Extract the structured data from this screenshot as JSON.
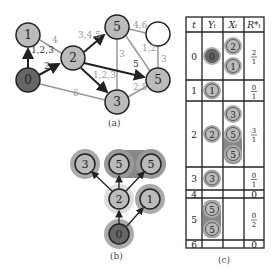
{
  "panels": {
    "a": {
      "caption": "(a)",
      "nodes": [
        {
          "id": "n1",
          "label": "1",
          "x": 28,
          "y": 35,
          "fill": "#bbbbbb"
        },
        {
          "id": "n0",
          "label": "0",
          "x": 28,
          "y": 80,
          "fill": "#666666"
        },
        {
          "id": "n2",
          "label": "2",
          "x": 73,
          "y": 58,
          "fill": "#bbbbbb"
        },
        {
          "id": "n5a",
          "label": "5",
          "x": 117,
          "y": 27,
          "fill": "#bbbbbb"
        },
        {
          "id": "nw",
          "label": "",
          "x": 158,
          "y": 34,
          "fill": "#ffffff"
        },
        {
          "id": "n5b",
          "label": "5",
          "x": 158,
          "y": 80,
          "fill": "#bbbbbb"
        },
        {
          "id": "n3",
          "label": "3",
          "x": 117,
          "y": 102,
          "fill": "#bbbbbb"
        }
      ],
      "edge_labels": [
        {
          "text": "1,2,3",
          "x": 31,
          "y": 53,
          "color": "#333"
        },
        {
          "text": "4",
          "x": 52,
          "y": 43,
          "color": "#999"
        },
        {
          "text": "2",
          "x": 44,
          "y": 69,
          "color": "#333"
        },
        {
          "text": "3,4,5",
          "x": 78,
          "y": 38,
          "color": "#999"
        },
        {
          "text": "1,2,3",
          "x": 93,
          "y": 78,
          "color": "#999"
        },
        {
          "text": "6",
          "x": 73,
          "y": 96,
          "color": "#999"
        },
        {
          "text": "5",
          "x": 133,
          "y": 67,
          "color": "#333"
        },
        {
          "text": "3",
          "x": 119,
          "y": 57,
          "color": "#999"
        },
        {
          "text": "4,6",
          "x": 133,
          "y": 28,
          "color": "#999"
        },
        {
          "text": "1,2",
          "x": 142,
          "y": 51,
          "color": "#999"
        },
        {
          "text": "3",
          "x": 161,
          "y": 62,
          "color": "#999"
        },
        {
          "text": "2,5",
          "x": 133,
          "y": 90,
          "color": "#999"
        }
      ]
    },
    "b": {
      "caption": "(b)",
      "nodes": [
        {
          "id": "b0",
          "label": "0",
          "x": 119,
          "y": 234,
          "fill": "#666666"
        },
        {
          "id": "b2",
          "label": "2",
          "x": 119,
          "y": 199,
          "fill": "#bbbbbb"
        },
        {
          "id": "b1",
          "label": "1",
          "x": 150,
          "y": 199,
          "fill": "#bbbbbb"
        },
        {
          "id": "b3",
          "label": "3",
          "x": 85,
          "y": 164,
          "fill": "#bbbbbb"
        },
        {
          "id": "b5a",
          "label": "5",
          "x": 119,
          "y": 164,
          "fill": "#bbbbbb"
        },
        {
          "id": "b5b",
          "label": "5",
          "x": 151,
          "y": 164,
          "fill": "#bbbbbb"
        }
      ]
    },
    "c": {
      "caption": "(c)",
      "headers": [
        "t",
        "Y_t",
        "X_t",
        "R*_t"
      ],
      "rows": [
        {
          "t": "0",
          "Y": [
            "0"
          ],
          "X": [
            "2",
            "1"
          ],
          "R": {
            "num": "2",
            "den": "1"
          }
        },
        {
          "t": "1",
          "Y": [
            "1"
          ],
          "X": [],
          "R": {
            "num": "0",
            "den": "1"
          }
        },
        {
          "t": "2",
          "Y": [
            "2"
          ],
          "X": [
            "3",
            "5",
            "5"
          ],
          "R": {
            "num": "3",
            "den": "1"
          }
        },
        {
          "t": "3",
          "Y": [
            "3"
          ],
          "X": [],
          "R": {
            "num": "0",
            "den": "1"
          }
        },
        {
          "t": "4",
          "Y": [],
          "X": [],
          "R": {
            "num": "0",
            "den": ""
          }
        },
        {
          "t": "5",
          "Y": [
            "5",
            "5"
          ],
          "X": [],
          "R": {
            "num": "0",
            "den": "2"
          }
        },
        {
          "t": "6",
          "Y": [],
          "X": [],
          "R": {
            "num": "0",
            "den": ""
          }
        }
      ]
    }
  }
}
